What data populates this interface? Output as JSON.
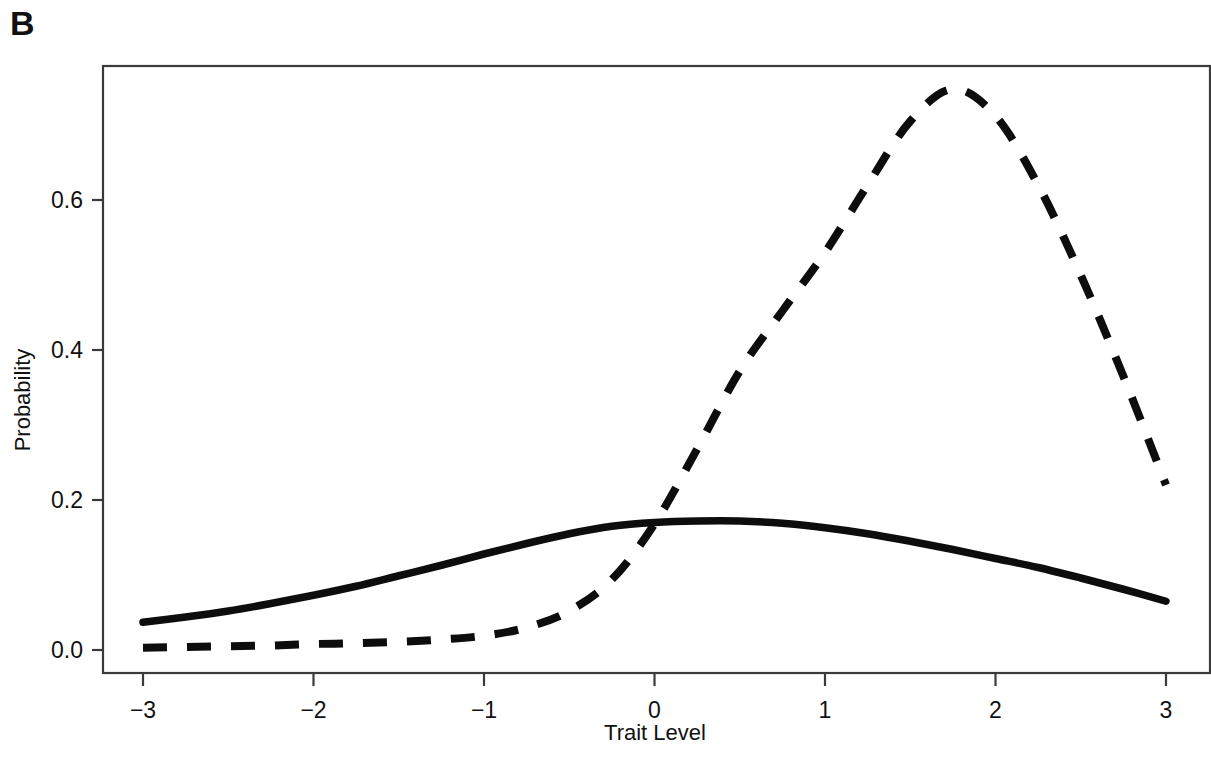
{
  "panel": {
    "label": "B"
  },
  "chart_data": {
    "type": "line",
    "title": "",
    "subtitle": "",
    "xlabel": "Trait Level",
    "ylabel": "Probability",
    "xlim": [
      -3,
      3
    ],
    "ylim": [
      0.0,
      0.8
    ],
    "grid": false,
    "legend": "none",
    "xticks": [
      -3,
      -2,
      -1,
      0,
      1,
      2,
      3
    ],
    "xtick_labels": [
      "−3",
      "−2",
      "−1",
      "0",
      "1",
      "2",
      "3"
    ],
    "yticks": [
      0.0,
      0.2,
      0.4,
      0.6
    ],
    "ytick_labels": [
      "0.0",
      "0.2",
      "0.4",
      "0.6"
    ],
    "x": [
      -3.0,
      -2.75,
      -2.5,
      -2.25,
      -2.0,
      -1.75,
      -1.5,
      -1.25,
      -1.0,
      -0.75,
      -0.5,
      -0.25,
      0.0,
      0.25,
      0.5,
      0.75,
      1.0,
      1.25,
      1.5,
      1.75,
      2.0,
      2.25,
      2.5,
      2.75,
      3.0
    ],
    "series": [
      {
        "name": "solid-curve",
        "style": "solid",
        "color": "#0d0d0d",
        "values": [
          0.037,
          0.044,
          0.052,
          0.062,
          0.073,
          0.085,
          0.099,
          0.113,
          0.128,
          0.142,
          0.155,
          0.165,
          0.17,
          0.172,
          0.172,
          0.169,
          0.163,
          0.155,
          0.145,
          0.134,
          0.122,
          0.11,
          0.096,
          0.081,
          0.065
        ]
      },
      {
        "name": "dashed-curve",
        "style": "dashed",
        "color": "#0d0d0d",
        "values": [
          0.003,
          0.004,
          0.005,
          0.006,
          0.008,
          0.009,
          0.011,
          0.014,
          0.019,
          0.03,
          0.052,
          0.094,
          0.168,
          0.268,
          0.372,
          0.452,
          0.53,
          0.62,
          0.705,
          0.748,
          0.712,
          0.62,
          0.5,
          0.365,
          0.22
        ]
      }
    ],
    "annotations": [
      {
        "name": "curve-crossing",
        "x": 0.02,
        "y": 0.168
      },
      {
        "name": "solid-peak",
        "x": 0.4,
        "y": 0.172
      },
      {
        "name": "dashed-peak",
        "x": 1.63,
        "y": 0.75
      }
    ]
  },
  "plot_box": {
    "left": 103,
    "top": 66,
    "right": 1210,
    "bottom": 673
  }
}
